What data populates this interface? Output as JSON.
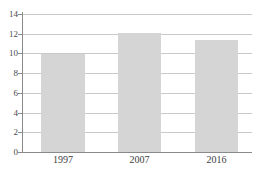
{
  "chart_data": {
    "type": "bar",
    "title": "",
    "subtitle": "",
    "xlabel": "",
    "ylabel": "",
    "categories": [
      "1997",
      "2007",
      "2016"
    ],
    "values": [
      9.9,
      12.1,
      11.4
    ],
    "series": [
      {
        "name": "",
        "values": [
          9.9,
          12.1,
          11.4
        ]
      }
    ],
    "ylim": [
      0,
      14
    ],
    "ytick_labels": [
      "0",
      "2",
      "4",
      "6",
      "8",
      "10",
      "12",
      "14"
    ],
    "ytick_values": [
      0,
      2,
      4,
      6,
      8,
      10,
      12,
      14
    ],
    "grid": true,
    "legend": false,
    "legend_position": "none",
    "annotations": [],
    "colors": {
      "bar_fill": "#d5d5d5",
      "gridline": "#c9c9c9",
      "axis": "#8a8a8a",
      "tick_text": "#4a4a4a",
      "category_text": "#3d3d3d",
      "background": "#ffffff"
    }
  }
}
